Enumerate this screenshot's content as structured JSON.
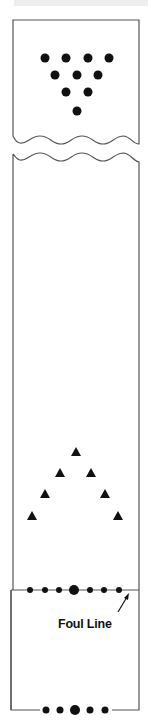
{
  "diagram": {
    "type": "bowling-lane",
    "pin_deck": {
      "pins": [
        {
          "x": 45,
          "y": 58
        },
        {
          "x": 66,
          "y": 58
        },
        {
          "x": 88,
          "y": 58
        },
        {
          "x": 109,
          "y": 58
        },
        {
          "x": 55,
          "y": 75
        },
        {
          "x": 77,
          "y": 75
        },
        {
          "x": 98,
          "y": 75
        },
        {
          "x": 66,
          "y": 92
        },
        {
          "x": 88,
          "y": 92
        },
        {
          "x": 77,
          "y": 111
        }
      ]
    },
    "target_arrows": [
      {
        "x": 76,
        "y": 452
      },
      {
        "x": 60,
        "y": 473
      },
      {
        "x": 91,
        "y": 473
      },
      {
        "x": 45,
        "y": 494
      },
      {
        "x": 105,
        "y": 494
      },
      {
        "x": 32,
        "y": 516
      },
      {
        "x": 118,
        "y": 516
      }
    ],
    "foul_line": {
      "label": "Foul Line",
      "dots": [
        {
          "x": 30,
          "r": 3
        },
        {
          "x": 45,
          "r": 3
        },
        {
          "x": 59,
          "r": 3
        },
        {
          "x": 74,
          "r": 5
        },
        {
          "x": 90,
          "r": 3
        },
        {
          "x": 104,
          "r": 3
        },
        {
          "x": 119,
          "r": 3
        }
      ]
    },
    "approach_dots": [
      {
        "x": 46,
        "r": 3.5
      },
      {
        "x": 60,
        "r": 3.5
      },
      {
        "x": 75,
        "r": 5
      },
      {
        "x": 90,
        "r": 3.5
      },
      {
        "x": 105,
        "r": 3.5
      }
    ],
    "colors": {
      "line": "#555555",
      "mark": "#111111"
    }
  }
}
